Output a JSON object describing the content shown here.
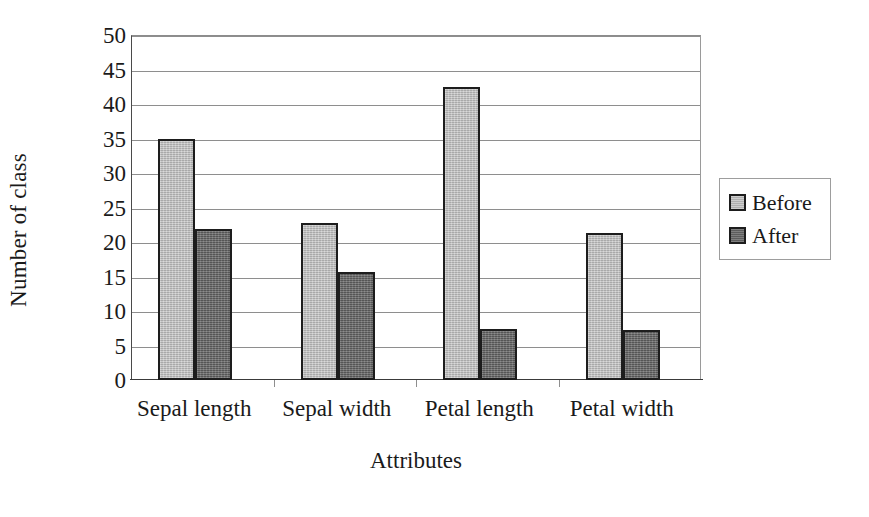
{
  "chart_data": {
    "type": "bar",
    "title": "",
    "xlabel": "Attributes",
    "ylabel": "Number of class",
    "categories": [
      "Sepal length",
      "Sepal width",
      "Petal length",
      "Petal width"
    ],
    "series": [
      {
        "name": "Before",
        "color": "#b9b9b9",
        "values": [
          35.0,
          22.7,
          42.5,
          21.3
        ]
      },
      {
        "name": "After",
        "color": "#676767",
        "values": [
          21.9,
          15.6,
          7.4,
          7.3
        ]
      }
    ],
    "ylim": [
      0,
      50
    ],
    "ytick_step": 5,
    "yticks": [
      "0",
      "5",
      "10",
      "15",
      "20",
      "25",
      "30",
      "35",
      "40",
      "45",
      "50"
    ],
    "grid": "horizontal",
    "legend_position": "right",
    "legend_entries": [
      "Before",
      "After"
    ],
    "bar_border_color": "#1d1d1d",
    "gridline_color": "#8e8e8e",
    "axis_color": "#3a3a3a"
  }
}
